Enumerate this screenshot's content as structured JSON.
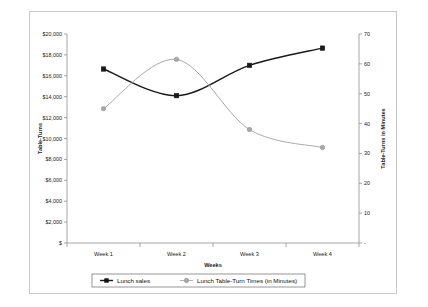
{
  "chart_data": {
    "type": "line",
    "title": "",
    "xlabel": "Weeks",
    "ylabel": "Table-Turns",
    "y2label": "Table-Turns in Minutes",
    "categories": [
      "Week 1",
      "Week 2",
      "Week 3",
      "Week 4"
    ],
    "grid": false,
    "legend_position": "bottom",
    "ylim": [
      0,
      20000
    ],
    "ytick_step": 2000,
    "ytick_labels": [
      "$",
      "$2,000",
      "$4,000",
      "$6,000",
      "$8,000",
      "$10,000",
      "$12,000",
      "$14,000",
      "$16,000",
      "$18,000",
      "$20,000"
    ],
    "ytick_values": [
      0,
      2000,
      4000,
      6000,
      8000,
      10000,
      12000,
      14000,
      16000,
      18000,
      20000
    ],
    "y2lim": [
      0,
      70
    ],
    "y2tick_step": 10,
    "y2tick_labels": [
      "-",
      "10",
      "20",
      "30",
      "40",
      "50",
      "60",
      "70"
    ],
    "y2tick_values": [
      0,
      10,
      20,
      30,
      40,
      50,
      60,
      70
    ],
    "series": [
      {
        "name": "Lunch sales",
        "axis": "left",
        "color": "#1a1a1a",
        "marker": "square",
        "values": [
          16650,
          14100,
          17000,
          18650
        ]
      },
      {
        "name": "Lunch Table-Turn Times (in Minutes)",
        "axis": "right",
        "color": "#aaaaaa",
        "marker": "circle",
        "values": [
          45,
          61.5,
          38,
          32
        ]
      }
    ]
  },
  "legend": {
    "items": [
      {
        "label": "Lunch sales",
        "marker": "square",
        "color": "#111111"
      },
      {
        "label": "Lunch Table-Turn Times (in Minutes)",
        "marker": "circle",
        "color": "#aaaaaa"
      }
    ]
  },
  "axes": {
    "x_title": "Weeks",
    "y_left_title": "Table-Turns",
    "y_right_title": "Table-Turns in Minutes"
  },
  "colors": {
    "series_primary": "#1a1a1a",
    "series_secondary": "#aaaaaa",
    "frame": "#c9c9c9",
    "axis": "#8f8f8f"
  }
}
